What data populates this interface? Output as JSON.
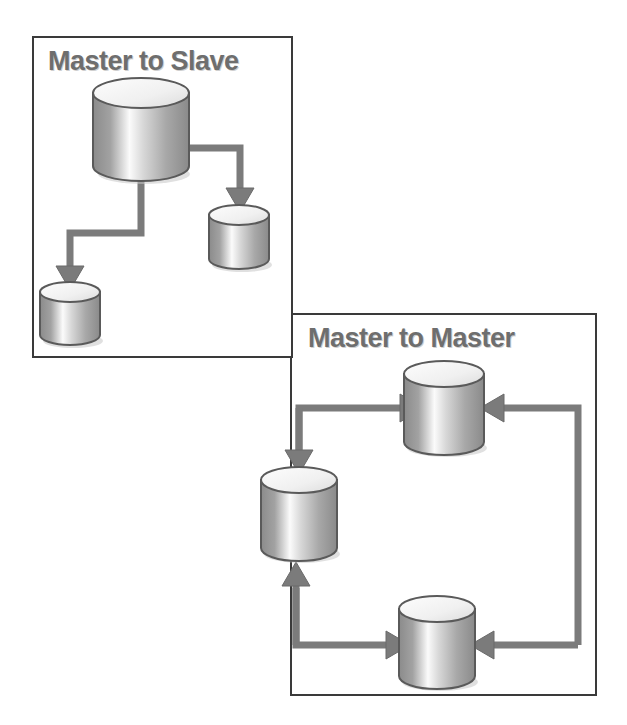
{
  "image": {
    "width": 627,
    "height": 725,
    "background": "#ffffff",
    "kind": "database-replication-topology-diagram"
  },
  "palette": {
    "panel_border": "#3a3a3a",
    "title_text": "#6e6e6e",
    "title_shadow": "#cfcfcf",
    "arrow": "#7b7b7b",
    "arrow_outline": "#5e5e5e",
    "cylinder_outline": "#5a5a5a",
    "cylinder_top": "#f2f2f2",
    "cylinder_body_dark": "#8f8f8f",
    "cylinder_body_light": "#fbfbfb",
    "drop_shadow": "#b8b8b8"
  },
  "panels": [
    {
      "id": "master-slave",
      "title": "Master to Slave",
      "x": 32,
      "y": 36,
      "width": 261,
      "height": 322,
      "nodes": [
        {
          "id": "ms-master",
          "role": "master",
          "size": "large",
          "cx": 141,
          "cy": 129
        },
        {
          "id": "ms-slave-right",
          "role": "slave",
          "size": "small",
          "cx": 239,
          "cy": 236
        },
        {
          "id": "ms-slave-left",
          "role": "slave",
          "size": "small",
          "cx": 70,
          "cy": 311
        }
      ],
      "edges": [
        {
          "id": "ms-edge-master-to-slave-right",
          "from": "ms-master",
          "to": "ms-slave-right",
          "direction": "one-way"
        },
        {
          "id": "ms-edge-master-to-slave-left",
          "from": "ms-master",
          "to": "ms-slave-left",
          "direction": "one-way"
        }
      ]
    },
    {
      "id": "master-master",
      "title": "Master to Master",
      "x": 290,
      "y": 313,
      "width": 307,
      "height": 383,
      "nodes": [
        {
          "id": "mm-top",
          "role": "master",
          "size": "medium",
          "cx": 444,
          "cy": 411
        },
        {
          "id": "mm-left",
          "role": "master",
          "size": "medium",
          "cx": 299,
          "cy": 517
        },
        {
          "id": "mm-bottom",
          "role": "master",
          "size": "medium",
          "cx": 437,
          "cy": 645
        }
      ],
      "edges": [
        {
          "id": "mm-edge-left-to-top",
          "from": "mm-left",
          "to": "mm-top",
          "direction": "one-way"
        },
        {
          "id": "mm-edge-top-to-left",
          "from": "mm-top",
          "to": "mm-left",
          "direction": "one-way"
        },
        {
          "id": "mm-edge-bottom-to-left",
          "from": "mm-bottom",
          "to": "mm-left",
          "direction": "one-way"
        },
        {
          "id": "mm-edge-left-to-bottom",
          "from": "mm-left",
          "to": "mm-bottom",
          "direction": "one-way"
        },
        {
          "id": "mm-edge-bottom-to-top",
          "from": "mm-bottom",
          "to": "mm-top",
          "direction": "one-way"
        }
      ]
    }
  ],
  "labels": {
    "master_to_slave": "Master to Slave",
    "master_to_master": "Master to Master"
  },
  "icons": {
    "database": "database-cylinder-icon",
    "arrow": "arrow-head-icon"
  }
}
